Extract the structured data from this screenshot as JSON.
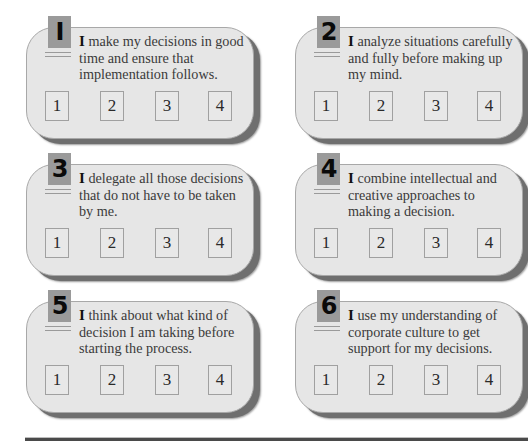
{
  "questionnaire": {
    "items": [
      {
        "number": "1",
        "badge_label": "I",
        "cap": "I",
        "text": " make my decisions in good time and ensure that implementation follows.",
        "scale": [
          "1",
          "2",
          "3",
          "4"
        ]
      },
      {
        "number": "2",
        "badge_label": "2",
        "cap": "I",
        "text": " analyze situations carefully and fully before making up my mind.",
        "scale": [
          "1",
          "2",
          "3",
          "4"
        ]
      },
      {
        "number": "3",
        "badge_label": "3",
        "cap": "I",
        "text": " delegate all those decisions that do not have to be taken by me.",
        "scale": [
          "1",
          "2",
          "3",
          "4"
        ]
      },
      {
        "number": "4",
        "badge_label": "4",
        "cap": "I",
        "text": " combine intellectual and creative approaches to making a decision.",
        "scale": [
          "1",
          "2",
          "3",
          "4"
        ]
      },
      {
        "number": "5",
        "badge_label": "5",
        "cap": "I",
        "text": " think about what kind of decision I am taking before starting the process.",
        "scale": [
          "1",
          "2",
          "3",
          "4"
        ]
      },
      {
        "number": "6",
        "badge_label": "6",
        "cap": "I",
        "text": " use my understanding of corporate culture to get support for my decisions.",
        "scale": [
          "1",
          "2",
          "3",
          "4"
        ]
      }
    ]
  },
  "colors": {
    "card_fill": "#e6e6e6",
    "card_shadow": "#6f6f6f",
    "badge_fill": "#9a9a9a",
    "box_border": "#a0a0a0",
    "text": "#3a3a3a"
  }
}
